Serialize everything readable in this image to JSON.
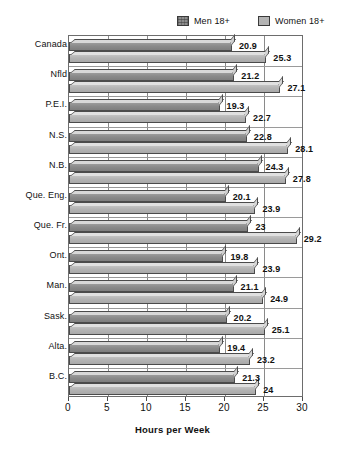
{
  "chart_data": {
    "type": "bar",
    "orientation": "horizontal",
    "title": "",
    "xlabel": "Hours per Week",
    "ylabel": "",
    "xlim": [
      0,
      30
    ],
    "xticks": [
      0,
      5,
      10,
      15,
      20,
      25,
      30
    ],
    "grid": true,
    "legend_position": "top-right",
    "categories": [
      "Canada",
      "Nfld",
      "P.E.I.",
      "N.S.",
      "N.B.",
      "Que. Eng.",
      "Que. Fr.",
      "Ont.",
      "Man.",
      "Sask.",
      "Alta.",
      "B.C."
    ],
    "series": [
      {
        "name": "Men 18+",
        "color": "#8d8d8d",
        "values": [
          20.9,
          21.2,
          19.3,
          22.8,
          24.3,
          20.1,
          23,
          19.8,
          21.1,
          20.2,
          19.4,
          21.3
        ],
        "labels": [
          "20.9",
          "21.2",
          "19.3",
          "22.8",
          "24.3",
          "20.1",
          "23",
          "19.8",
          "21.1",
          "20.2",
          "19.4",
          "21.3"
        ]
      },
      {
        "name": "Women 18+",
        "color": "#b6b6b6",
        "values": [
          25.3,
          27.1,
          22.7,
          28.1,
          27.8,
          23.9,
          29.2,
          23.9,
          24.9,
          25.1,
          23.2,
          24
        ],
        "labels": [
          "25.3",
          "27.1",
          "22.7",
          "28.1",
          "27.8",
          "23.9",
          "29.2",
          "23.9",
          "24.9",
          "25.1",
          "23.2",
          "24"
        ]
      }
    ]
  },
  "legend": {
    "men": {
      "label": "Men 18+",
      "swatch": "men-swatch-icon"
    },
    "women": {
      "label": "Women 18+",
      "swatch": "women-swatch-icon"
    }
  },
  "axis": {
    "x_title": "Hours per Week",
    "tick_labels": [
      "0",
      "5",
      "10",
      "15",
      "20",
      "25",
      "30"
    ]
  }
}
